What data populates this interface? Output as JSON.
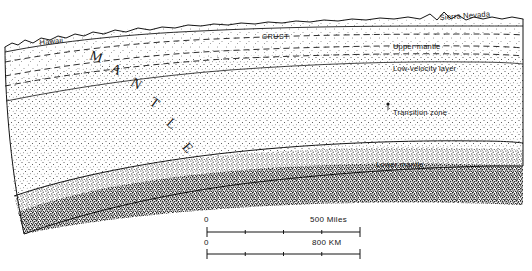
{
  "figure": {
    "title_text": "",
    "labels": {
      "hawaii": "Hawaii",
      "sierra_nevada": "Sierra Nevada",
      "crust": "CRUST",
      "upper_mantle": "Upper mantle",
      "low_velocity_layer": "Low-velocity layer",
      "transition_zone": "Transition zone",
      "lower_mantle": "Lower mantle",
      "mantle_letters": [
        "M",
        "A",
        "N",
        "T",
        "L",
        "E"
      ]
    },
    "scale_bars": [
      {
        "name": "miles",
        "start_label": "0",
        "end_label": "500 Miles"
      },
      {
        "name": "kilometers",
        "start_label": "0",
        "end_label": "800 KM"
      }
    ],
    "colors": {
      "ink": "#151515",
      "background": "#ffffff",
      "stipple": "#2b2b2b"
    }
  }
}
